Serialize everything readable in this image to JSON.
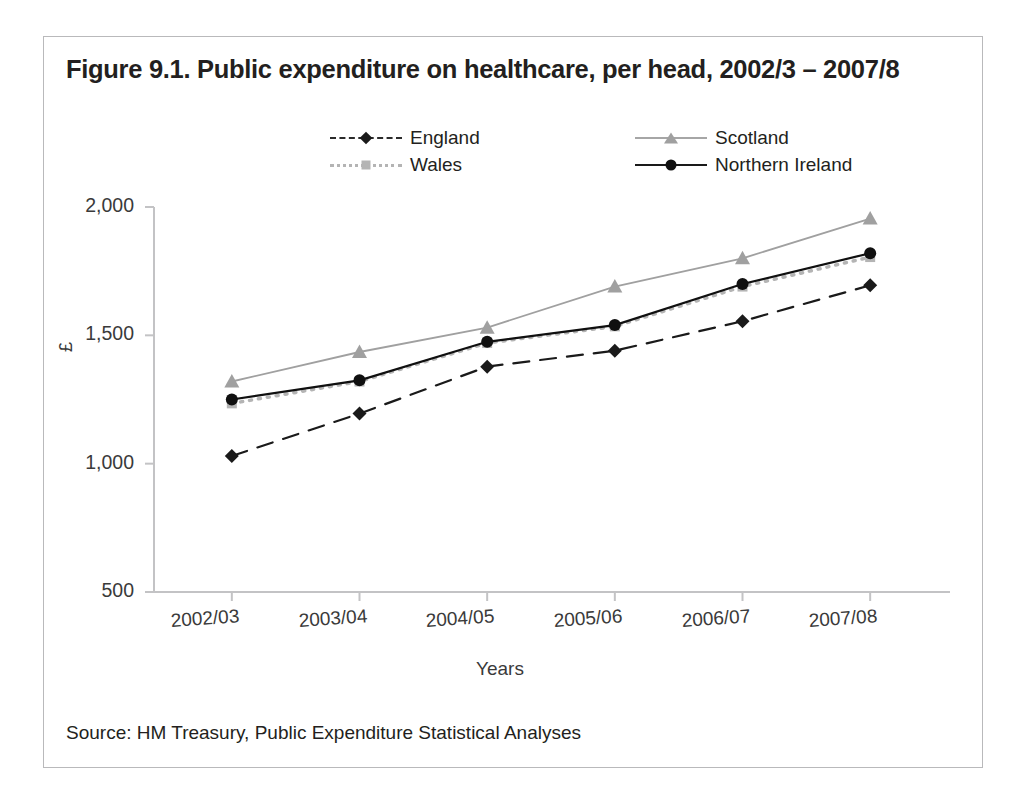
{
  "figure": {
    "title": "Figure 9.1. Public expenditure on healthcare, per head, 2002/3 – 2007/8",
    "source": "Source: HM Treasury, Public Expenditure Statistical Analyses"
  },
  "chart_data": {
    "type": "line",
    "title": "Figure 9.1. Public expenditure on healthcare, per head, 2002/3 – 2007/8",
    "xlabel": "Years",
    "ylabel": "£",
    "categories": [
      "2002/03",
      "2003/04",
      "2004/05",
      "2005/06",
      "2006/07",
      "2007/08"
    ],
    "ylim": [
      500,
      2000
    ],
    "yticks": [
      500,
      1000,
      1500,
      2000
    ],
    "ytick_labels": [
      "500",
      "1,000",
      "1,500",
      "2,000"
    ],
    "grid": false,
    "legend_position": "top-center",
    "series": [
      {
        "name": "England",
        "marker": "diamond",
        "line_style": "dashed",
        "color": "#1a1a1a",
        "values": [
          1030,
          1195,
          1378,
          1440,
          1555,
          1695
        ]
      },
      {
        "name": "Wales",
        "marker": "square",
        "line_style": "dotted",
        "color": "#b4b4b4",
        "values": [
          1235,
          1320,
          1470,
          1535,
          1690,
          1805
        ]
      },
      {
        "name": "Scotland",
        "marker": "triangle",
        "line_style": "solid",
        "color": "#a0a0a0",
        "values": [
          1320,
          1435,
          1530,
          1690,
          1800,
          1955
        ]
      },
      {
        "name": "Northern Ireland",
        "marker": "circle",
        "line_style": "solid",
        "color": "#101010",
        "values": [
          1250,
          1325,
          1475,
          1540,
          1700,
          1820
        ]
      }
    ]
  }
}
